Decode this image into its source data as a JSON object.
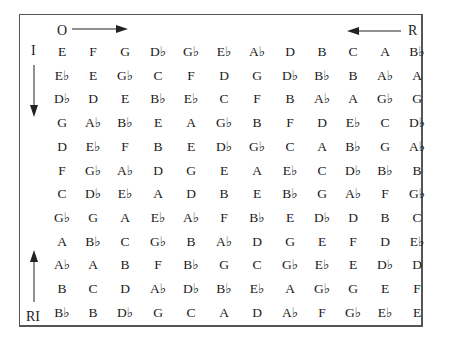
{
  "labels": {
    "original": "O",
    "retrograde": "R",
    "inversion": "I",
    "retrograde_inversion": "RI"
  },
  "matrix": [
    [
      "E",
      "F",
      "G",
      "D♭",
      "G♭",
      "E♭",
      "A♭",
      "D",
      "B",
      "C",
      "A",
      "B♭"
    ],
    [
      "E♭",
      "E",
      "G♭",
      "C",
      "F",
      "D",
      "G",
      "D♭",
      "B♭",
      "B",
      "A♭",
      "A"
    ],
    [
      "D♭",
      "D",
      "E",
      "B♭",
      "E♭",
      "C",
      "F",
      "B",
      "A♭",
      "A",
      "G♭",
      "G"
    ],
    [
      "G",
      "A♭",
      "B♭",
      "E",
      "A",
      "G♭",
      "B",
      "F",
      "D",
      "E♭",
      "C",
      "D♭"
    ],
    [
      "D",
      "E♭",
      "F",
      "B",
      "E",
      "D♭",
      "G♭",
      "C",
      "A",
      "B♭",
      "G",
      "A♭"
    ],
    [
      "F",
      "G♭",
      "A♭",
      "D",
      "G",
      "E",
      "A",
      "E♭",
      "C",
      "D♭",
      "B♭",
      "B"
    ],
    [
      "C",
      "D♭",
      "E♭",
      "A",
      "D",
      "B",
      "E",
      "B♭",
      "G",
      "A♭",
      "F",
      "G♭"
    ],
    [
      "G♭",
      "G",
      "A",
      "E♭",
      "A♭",
      "F",
      "B♭",
      "E",
      "D♭",
      "D",
      "B",
      "C"
    ],
    [
      "A",
      "B♭",
      "C",
      "G♭",
      "B",
      "A♭",
      "D",
      "G",
      "E",
      "F",
      "D",
      "E♭"
    ],
    [
      "A♭",
      "A",
      "B",
      "F",
      "B♭",
      "G",
      "C",
      "G♭",
      "E♭",
      "E",
      "D♭",
      "D"
    ],
    [
      "B",
      "C",
      "D",
      "A♭",
      "D♭",
      "B♭",
      "E♭",
      "A",
      "G♭",
      "G",
      "E",
      "F"
    ],
    [
      "B♭",
      "B",
      "D♭",
      "G",
      "C",
      "A",
      "D",
      "A♭",
      "F",
      "G♭",
      "E♭",
      "E"
    ]
  ]
}
